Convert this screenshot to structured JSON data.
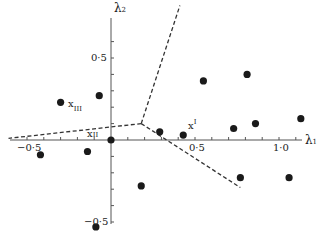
{
  "chart_data": {
    "type": "scatter",
    "title": "",
    "xlabel": "λ1",
    "ylabel": "λ2",
    "xlim": [
      -0.6,
      1.15
    ],
    "ylim": [
      -0.55,
      0.8
    ],
    "grid": false,
    "x_ticks": [
      -0.5,
      0.5,
      1.0
    ],
    "x_tick_labels": [
      "−0·5",
      "0·5",
      "1·0"
    ],
    "y_ticks": [
      0.5,
      -0.5
    ],
    "y_tick_labels": [
      "0·5",
      "−0·5"
    ],
    "points": [
      {
        "x": -0.3,
        "y": 0.23,
        "label": "XIII"
      },
      {
        "x": -0.07,
        "y": 0.27
      },
      {
        "x": 0.0,
        "y": 0.0,
        "label": "XII"
      },
      {
        "x": -0.42,
        "y": -0.09
      },
      {
        "x": -0.14,
        "y": -0.07
      },
      {
        "x": -0.09,
        "y": -0.53
      },
      {
        "x": 0.18,
        "y": -0.28
      },
      {
        "x": 0.29,
        "y": 0.05
      },
      {
        "x": 0.43,
        "y": 0.03,
        "label": "XI"
      },
      {
        "x": 0.55,
        "y": 0.36
      },
      {
        "x": 0.81,
        "y": 0.4
      },
      {
        "x": 0.73,
        "y": 0.07
      },
      {
        "x": 0.86,
        "y": 0.1
      },
      {
        "x": 1.13,
        "y": 0.13
      },
      {
        "x": 0.77,
        "y": -0.23
      },
      {
        "x": 1.06,
        "y": -0.23
      }
    ],
    "boundaries": [
      {
        "from": [
          0.18,
          0.1
        ],
        "to": [
          0.41,
          0.82
        ],
        "style": "dashed"
      },
      {
        "from": [
          0.18,
          0.1
        ],
        "to": [
          -0.61,
          0.01
        ],
        "style": "dashed"
      },
      {
        "from": [
          0.18,
          0.1
        ],
        "to": [
          0.77,
          -0.29
        ],
        "style": "dashed"
      }
    ],
    "annotations": [
      {
        "text": "x",
        "sub": "III",
        "near": [
          -0.3,
          0.23
        ]
      },
      {
        "text": "x",
        "sub": "II",
        "near": [
          -0.07,
          0.02
        ]
      },
      {
        "text": "x",
        "sub": "I",
        "near": [
          0.43,
          0.03
        ]
      }
    ]
  },
  "labels": {
    "xaxis": "λ",
    "xaxis_sub": "1",
    "yaxis": "λ",
    "yaxis_sub": "2",
    "xtick_neg": "−0·5",
    "xtick_pos": "0·5",
    "xtick_one": "1·0",
    "ytick_pos": "0·5",
    "ytick_neg": "−0·5",
    "mark_x": "x",
    "mark_I": "I",
    "mark_II": "II",
    "mark_III": "III"
  }
}
